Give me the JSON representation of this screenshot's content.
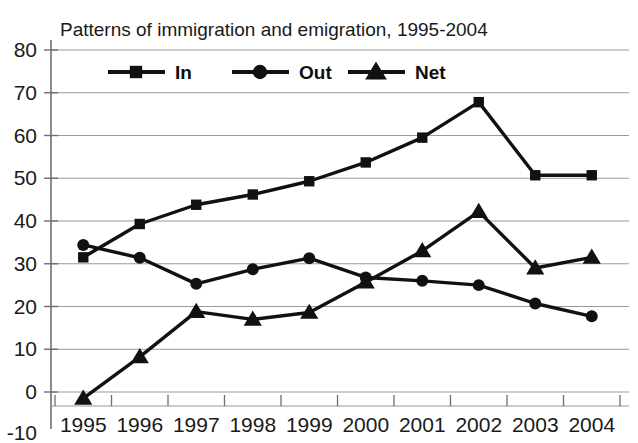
{
  "chart_data": {
    "type": "line",
    "title": "Patterns of immigration and emigration, 1995-2004",
    "xlabel": "",
    "ylabel": "",
    "categories": [
      "1995",
      "1996",
      "1997",
      "1998",
      "1999",
      "2000",
      "2001",
      "2002",
      "2003",
      "2004"
    ],
    "x": [
      1995,
      1996,
      1997,
      1998,
      1999,
      2000,
      2001,
      2002,
      2003,
      2004
    ],
    "ylim": [
      -10,
      80
    ],
    "ytick_labels": [
      "80",
      "70",
      "60",
      "50",
      "40",
      "30",
      "20",
      "10",
      "0",
      "-10"
    ],
    "yticks": [
      80,
      70,
      60,
      50,
      40,
      30,
      20,
      10,
      0,
      -10
    ],
    "grid": true,
    "grid_axis": "y",
    "legend_position": "top-inside",
    "series": [
      {
        "name": "In",
        "marker": "square",
        "color": "#111111",
        "values": [
          31.5,
          39.3,
          43.8,
          46.2,
          49.3,
          53.7,
          59.5,
          67.8,
          50.7,
          50.7
        ]
      },
      {
        "name": "Out",
        "marker": "circle",
        "color": "#111111",
        "values": [
          34.4,
          31.4,
          25.3,
          28.7,
          31.3,
          26.8,
          26.0,
          25.0,
          20.7,
          17.7
        ]
      },
      {
        "name": "Net",
        "marker": "triangle",
        "color": "#111111",
        "values": [
          -1.5,
          8.2,
          18.8,
          17.0,
          18.6,
          25.7,
          33.0,
          42.2,
          29.0,
          31.5
        ]
      }
    ]
  },
  "legend": {
    "items": [
      {
        "label": "In",
        "marker": "square"
      },
      {
        "label": "Out",
        "marker": "circle"
      },
      {
        "label": "Net",
        "marker": "triangle"
      }
    ]
  },
  "colors": {
    "series": "#111111",
    "grid": "#9a9a9a",
    "axis": "#6f6f6f",
    "text": "#1a1a1a"
  }
}
